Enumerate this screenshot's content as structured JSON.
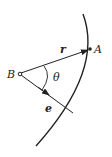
{
  "diagram": {
    "labels": {
      "point_a": "A",
      "point_b": "B",
      "vector_r": "r",
      "vector_e": "e",
      "angle": "θ"
    },
    "colors": {
      "stroke": "#222222",
      "background": "#ffffff"
    }
  }
}
